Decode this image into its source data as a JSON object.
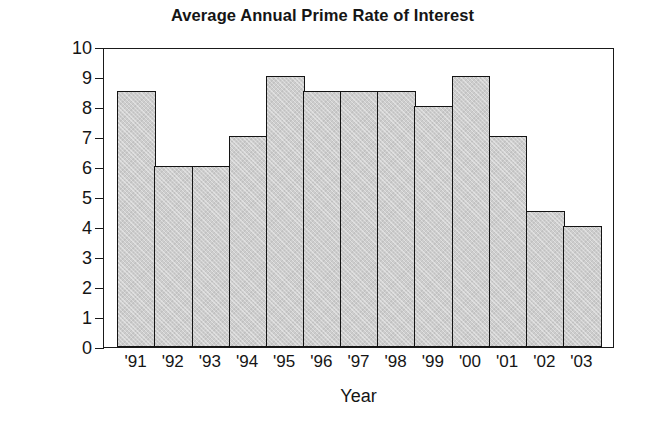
{
  "chart_data": {
    "type": "bar",
    "title": "Average Annual Prime Rate of Interest",
    "xlabel": "Year",
    "ylabel": "Prime Rate (%)",
    "categories": [
      "'91",
      "'92",
      "'93",
      "'94",
      "'95",
      "'96",
      "'97",
      "'98",
      "'99",
      "'00",
      "'01",
      "'02",
      "'03"
    ],
    "values": [
      8.5,
      6.0,
      6.0,
      7.0,
      9.0,
      8.5,
      8.5,
      8.5,
      8.0,
      9.0,
      7.0,
      4.5,
      4.0
    ],
    "ylim": [
      0,
      10
    ],
    "yticks": [
      0,
      1,
      2,
      3,
      4,
      5,
      6,
      7,
      8,
      9,
      10
    ],
    "ytick_labels": [
      "0",
      "1",
      "2",
      "3",
      "4",
      "5",
      "6",
      "7",
      "8",
      "9",
      "10"
    ],
    "grid": false,
    "legend": false,
    "bar_fill_color": "#cdcdcd",
    "bar_edge_color": "#141414",
    "axis_color": "#1a1a1a",
    "background_color": "#ffffff"
  }
}
